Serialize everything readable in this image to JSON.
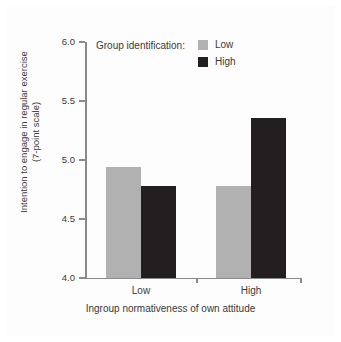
{
  "chart_data": {
    "type": "bar",
    "title": "",
    "subtitle": "",
    "xlabel": "Ingroup normativeness of own attitude",
    "ylabel": "Intention to engage in regular exercise\n(7-point scale)",
    "ylabel_line1": "Intention to engage in regular exercise",
    "ylabel_line2": "(7-point scale)",
    "categories": [
      "Low",
      "High"
    ],
    "series": [
      {
        "name": "Low",
        "color": "#b1b1b1",
        "values": [
          4.94,
          4.78
        ]
      },
      {
        "name": "High",
        "color": "#231f20",
        "values": [
          4.78,
          5.36
        ]
      }
    ],
    "ylim": [
      4.0,
      6.0
    ],
    "yticks": [
      "4.0",
      "4.5",
      "5.0",
      "5.5",
      "6.0"
    ],
    "ytick_values": [
      4.0,
      4.5,
      5.0,
      5.5,
      6.0
    ],
    "grid": false,
    "legend_position": "top-right-inside",
    "legend_title": "Group identification:",
    "legend_entries": [
      {
        "label": "Low",
        "color": "#b1b1b1"
      },
      {
        "label": "High",
        "color": "#231f20"
      }
    ]
  },
  "axes": {
    "y_ticks": [
      {
        "label": "6.0",
        "value": 6.0
      },
      {
        "label": "5.5",
        "value": 5.5
      },
      {
        "label": "5.0",
        "value": 5.0
      },
      {
        "label": "4.5",
        "value": 4.5
      },
      {
        "label": "4.0",
        "value": 4.0
      }
    ],
    "x_ticks": [
      {
        "label": "Low"
      },
      {
        "label": "High"
      }
    ],
    "x_title": "Ingroup normativeness of own attitude",
    "y_title_line1": "Intention to engage in regular exercise",
    "y_title_line2": "(7-point scale)"
  },
  "legend": {
    "title": "Group identification:",
    "items": [
      {
        "label": "Low",
        "color": "#b1b1b1"
      },
      {
        "label": "High",
        "color": "#231f20"
      }
    ]
  },
  "colors": {
    "gray_series": "#b1b1b1",
    "black_series": "#231f20",
    "axis": "#8a8a8a",
    "text": "#3a3a3a",
    "background": "#ffffff"
  }
}
